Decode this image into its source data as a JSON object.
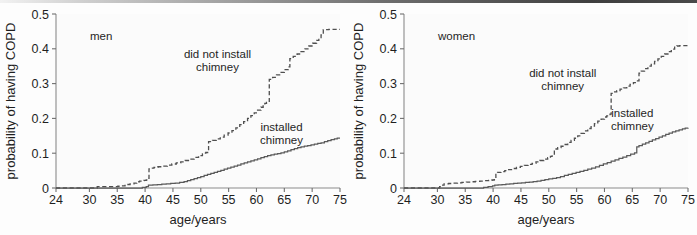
{
  "figure": {
    "name": "copd-chimney-kaplan-meier-figure",
    "width": 697,
    "height": 235,
    "background_color": "#fdfdfd",
    "top_rule_color": "#4a4a4a"
  },
  "chart_data": [
    {
      "id": "men",
      "type": "line",
      "subtype": "step",
      "title": "men",
      "panel_label": "men",
      "xlabel": "age/years",
      "ylabel": "probability of having COPD",
      "xlim": [
        24,
        75
      ],
      "ylim": [
        0,
        0.5
      ],
      "xticks": [
        24,
        30,
        35,
        40,
        45,
        50,
        55,
        60,
        65,
        70,
        75
      ],
      "xtick_labels": [
        "24",
        "30",
        "35",
        "40",
        "45",
        "50",
        "55",
        "60",
        "65",
        "70",
        "75"
      ],
      "yticks": [
        0,
        0.1,
        0.2,
        0.3,
        0.4,
        0.5
      ],
      "ytick_labels": [
        "0",
        "0.1",
        "0.2",
        "0.3",
        "0.4",
        "0.5"
      ],
      "grid": false,
      "legend_position": "inline-annotations",
      "series": [
        {
          "name": "did not install chimney",
          "style": "dashed",
          "color": "#4f4f4f",
          "label_lines": [
            "did not install",
            "chimney"
          ],
          "label_x": 53.0,
          "label_y": 0.375,
          "x": [
            24,
            30.6,
            31.4,
            32.3,
            33.2,
            34.2,
            35.1,
            35.6,
            36.4,
            37.3,
            38.0,
            38.5,
            39.0,
            39.4,
            39.8,
            40.2,
            40.5,
            40.7,
            41.0,
            41.6,
            42.3,
            43.1,
            44.0,
            44.8,
            45.6,
            46.4,
            47.2,
            48.0,
            48.8,
            49.6,
            50.3,
            50.6,
            50.9,
            51.4,
            52.1,
            52.8,
            53.5,
            54.2,
            54.9,
            55.6,
            56.3,
            57.0,
            57.7,
            58.4,
            59.0,
            59.6,
            60.2,
            60.8,
            61.2,
            61.5,
            61.8,
            62.3,
            62.9,
            63.6,
            64.3,
            65.0,
            65.7,
            66.0,
            66.6,
            67.3,
            68.0,
            68.7,
            69.4,
            70.1,
            70.8,
            71.2,
            71.6,
            72.0,
            73.0,
            75
          ],
          "y": [
            0.0,
            0.0,
            0.004,
            0.004,
            0.004,
            0.004,
            0.005,
            0.006,
            0.01,
            0.012,
            0.014,
            0.018,
            0.02,
            0.021,
            0.022,
            0.023,
            0.028,
            0.055,
            0.057,
            0.059,
            0.061,
            0.063,
            0.066,
            0.069,
            0.072,
            0.075,
            0.079,
            0.083,
            0.088,
            0.093,
            0.098,
            0.1,
            0.102,
            0.133,
            0.137,
            0.141,
            0.146,
            0.152,
            0.158,
            0.165,
            0.173,
            0.182,
            0.191,
            0.2,
            0.208,
            0.216,
            0.224,
            0.232,
            0.24,
            0.243,
            0.246,
            0.312,
            0.318,
            0.325,
            0.332,
            0.34,
            0.348,
            0.372,
            0.378,
            0.385,
            0.392,
            0.4,
            0.408,
            0.416,
            0.424,
            0.432,
            0.44,
            0.455,
            0.456,
            0.456
          ]
        },
        {
          "name": "installed chimney",
          "style": "solid",
          "color": "#5a5a5a",
          "label_lines": [
            "installed",
            "chimney"
          ],
          "label_x": 64.5,
          "label_y": 0.165,
          "x": [
            24,
            38.8,
            39.5,
            40.2,
            40.6,
            41.4,
            42.2,
            43.0,
            43.8,
            44.6,
            45.4,
            46.2,
            47.0,
            47.6,
            48.2,
            48.8,
            49.4,
            50.0,
            50.6,
            51.2,
            51.8,
            52.4,
            53.0,
            53.6,
            54.2,
            54.8,
            55.4,
            56.0,
            56.6,
            57.2,
            57.8,
            58.4,
            59.0,
            59.6,
            60.2,
            60.8,
            61.4,
            62.0,
            62.6,
            63.2,
            63.8,
            64.4,
            65.0,
            65.6,
            66.2,
            66.8,
            67.4,
            68.0,
            68.6,
            69.2,
            69.8,
            70.4,
            71.0,
            71.6,
            72.2,
            72.8,
            73.4,
            74.0,
            74.5,
            75
          ],
          "y": [
            0.0,
            0.0,
            0.002,
            0.004,
            0.008,
            0.009,
            0.01,
            0.011,
            0.012,
            0.013,
            0.014,
            0.016,
            0.018,
            0.021,
            0.024,
            0.027,
            0.03,
            0.033,
            0.036,
            0.039,
            0.042,
            0.045,
            0.048,
            0.051,
            0.054,
            0.057,
            0.06,
            0.063,
            0.066,
            0.069,
            0.072,
            0.075,
            0.078,
            0.081,
            0.084,
            0.087,
            0.09,
            0.093,
            0.095,
            0.097,
            0.099,
            0.101,
            0.104,
            0.107,
            0.11,
            0.113,
            0.116,
            0.118,
            0.12,
            0.122,
            0.124,
            0.126,
            0.128,
            0.13,
            0.133,
            0.136,
            0.139,
            0.141,
            0.143,
            0.143
          ]
        }
      ]
    },
    {
      "id": "women",
      "type": "line",
      "subtype": "step",
      "title": "women",
      "panel_label": "women",
      "xlabel": "age/years",
      "ylabel": "probability of having COPD",
      "xlim": [
        24,
        75
      ],
      "ylim": [
        0,
        0.5
      ],
      "xticks": [
        24,
        30,
        35,
        40,
        45,
        50,
        55,
        60,
        65,
        70,
        75
      ],
      "xtick_labels": [
        "24",
        "30",
        "35",
        "40",
        "45",
        "50",
        "55",
        "60",
        "65",
        "70",
        "75"
      ],
      "yticks": [
        0,
        0.1,
        0.2,
        0.3,
        0.4,
        0.5
      ],
      "ytick_labels": [
        "0",
        "0.1",
        "0.2",
        "0.3",
        "0.4",
        "0.5"
      ],
      "grid": false,
      "legend_position": "inline-annotations",
      "series": [
        {
          "name": "did not install chimney",
          "style": "dashed",
          "color": "#4f4f4f",
          "label_lines": [
            "did not install",
            "chimney"
          ],
          "label_x": 52.5,
          "label_y": 0.318,
          "x": [
            24,
            29.8,
            30.4,
            30.8,
            31.2,
            32.0,
            32.8,
            33.6,
            34.4,
            35.2,
            36.0,
            36.8,
            37.6,
            38.4,
            39.2,
            39.8,
            40.2,
            40.5,
            40.8,
            41.4,
            42.1,
            42.8,
            43.5,
            44.2,
            44.9,
            45.6,
            46.3,
            47.0,
            47.7,
            48.4,
            49.1,
            49.8,
            50.3,
            50.6,
            51.0,
            51.6,
            52.2,
            52.8,
            53.4,
            54.0,
            54.6,
            55.2,
            55.8,
            56.4,
            57.0,
            57.6,
            58.2,
            58.8,
            59.4,
            60.0,
            60.4,
            60.8,
            61.0,
            61.2,
            61.6,
            62.2,
            62.8,
            63.4,
            64.0,
            64.6,
            65.2,
            65.8,
            66.2,
            66.6,
            67.2,
            67.8,
            68.4,
            69.0,
            69.6,
            70.2,
            70.8,
            71.4,
            72.0,
            72.6,
            73.0,
            73.5,
            75
          ],
          "y": [
            0.0,
            0.0,
            0.004,
            0.008,
            0.012,
            0.013,
            0.014,
            0.015,
            0.016,
            0.017,
            0.018,
            0.019,
            0.02,
            0.021,
            0.022,
            0.023,
            0.024,
            0.043,
            0.045,
            0.047,
            0.05,
            0.053,
            0.056,
            0.059,
            0.062,
            0.065,
            0.068,
            0.071,
            0.075,
            0.079,
            0.083,
            0.087,
            0.091,
            0.095,
            0.112,
            0.116,
            0.12,
            0.125,
            0.131,
            0.137,
            0.143,
            0.15,
            0.157,
            0.164,
            0.171,
            0.178,
            0.185,
            0.192,
            0.198,
            0.204,
            0.207,
            0.209,
            0.212,
            0.272,
            0.276,
            0.28,
            0.284,
            0.288,
            0.293,
            0.298,
            0.303,
            0.308,
            0.33,
            0.336,
            0.343,
            0.35,
            0.357,
            0.364,
            0.371,
            0.378,
            0.385,
            0.392,
            0.399,
            0.405,
            0.408,
            0.409,
            0.409
          ]
        },
        {
          "name": "installed chimney",
          "style": "solid",
          "color": "#5a5a5a",
          "label_lines": [
            "installed",
            "chimney"
          ],
          "label_x": 65.0,
          "label_y": 0.205,
          "x": [
            24,
            37.5,
            38.3,
            39.1,
            39.9,
            40.3,
            40.9,
            41.6,
            42.3,
            43.0,
            43.7,
            44.4,
            45.1,
            45.8,
            46.5,
            47.2,
            47.9,
            48.6,
            49.3,
            50.0,
            50.7,
            51.4,
            52.1,
            52.8,
            53.5,
            54.2,
            54.9,
            55.6,
            56.3,
            57.0,
            57.7,
            58.4,
            59.1,
            59.8,
            60.5,
            61.2,
            61.9,
            62.6,
            63.3,
            64.0,
            64.7,
            65.4,
            65.8,
            66.2,
            66.8,
            67.4,
            68.0,
            68.6,
            69.2,
            69.8,
            70.4,
            71.0,
            71.6,
            72.2,
            72.8,
            73.4,
            74.0,
            74.5,
            75
          ],
          "y": [
            0.0,
            0.0,
            0.002,
            0.004,
            0.006,
            0.008,
            0.009,
            0.01,
            0.011,
            0.012,
            0.013,
            0.014,
            0.015,
            0.016,
            0.017,
            0.018,
            0.02,
            0.022,
            0.024,
            0.026,
            0.028,
            0.03,
            0.033,
            0.036,
            0.039,
            0.042,
            0.045,
            0.048,
            0.051,
            0.054,
            0.057,
            0.061,
            0.065,
            0.069,
            0.073,
            0.077,
            0.081,
            0.085,
            0.089,
            0.093,
            0.097,
            0.101,
            0.118,
            0.122,
            0.126,
            0.13,
            0.134,
            0.138,
            0.142,
            0.146,
            0.15,
            0.154,
            0.158,
            0.161,
            0.164,
            0.167,
            0.17,
            0.172,
            0.173
          ]
        }
      ]
    }
  ]
}
